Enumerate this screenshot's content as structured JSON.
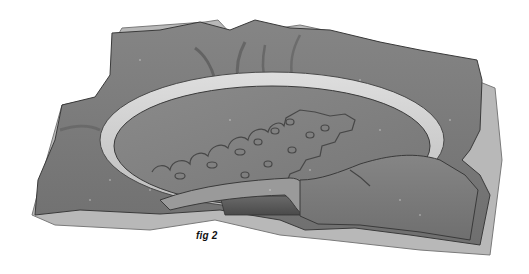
{
  "figure": {
    "caption": "fig 2",
    "colors": {
      "background": "#ffffff",
      "fabric": "#7a7a7a",
      "fabric_light": "#b5b5b5",
      "hoop": "#d2d2d2",
      "outline": "#3a3a3a",
      "caption": "#111111"
    }
  }
}
